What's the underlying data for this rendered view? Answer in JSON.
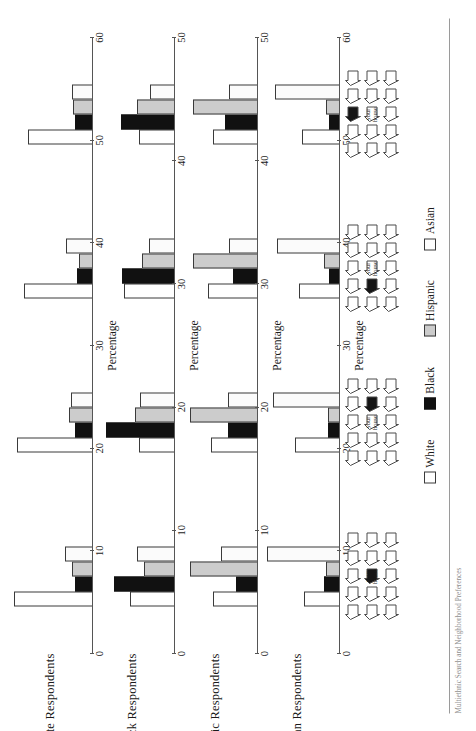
{
  "figure": {
    "caption": "Multiethnic Search and Neighborhood Preferences",
    "legend_title": ""
  },
  "legend": {
    "items": [
      {
        "label": "White",
        "key": "white",
        "color": "#ffffff"
      },
      {
        "label": "Black",
        "key": "black",
        "color": "#111111"
      },
      {
        "label": "Hispanic",
        "key": "hispanic",
        "color": "#cccccc"
      },
      {
        "label": "Asian",
        "key": "asian",
        "color": "#ffffff"
      }
    ]
  },
  "axis": {
    "title": "Percentage"
  },
  "neighborhoods": [
    {
      "name": "neighborhood-a",
      "your_house_label": [
        "your",
        "house"
      ],
      "rows": 3,
      "cols": 5,
      "shaded_index": 7,
      "center_index": 7
    },
    {
      "name": "neighborhood-b",
      "your_house_label": [
        "your",
        "house"
      ],
      "rows": 3,
      "cols": 5,
      "shaded_index": 8,
      "center_index": 7
    },
    {
      "name": "neighborhood-c",
      "your_house_label": [
        "your",
        "house"
      ],
      "rows": 3,
      "cols": 5,
      "shaded_index": 6,
      "center_index": 7
    },
    {
      "name": "neighborhood-d",
      "your_house_label": [
        "your",
        "house"
      ],
      "rows": 3,
      "cols": 5,
      "shaded_index": 2,
      "center_index": 7
    }
  ],
  "chart_data": {
    "type": "bar",
    "title": "",
    "xlabel": "",
    "ylabel": "Percentage",
    "grid": false,
    "legend_position": "bottom",
    "categories": [
      "Neighborhood A",
      "Neighborhood B",
      "Neighborhood C",
      "Neighborhood D"
    ],
    "series_names": [
      "White",
      "Black",
      "Hispanic",
      "Asian"
    ],
    "panels": [
      {
        "title": "White Respondents",
        "ylim": [
          0,
          60
        ],
        "yticks": [
          0,
          10,
          20,
          30,
          40,
          50,
          60
        ],
        "ytick_labels": [
          "0",
          "10",
          "20",
          "30",
          "40",
          "50",
          "60"
        ],
        "series": [
          {
            "name": "White",
            "values": [
              57,
              55,
              50,
              47
            ]
          },
          {
            "name": "Black",
            "values": [
              13,
              13,
              11,
              13
            ]
          },
          {
            "name": "Hispanic",
            "values": [
              15,
              17,
              10,
              14
            ]
          },
          {
            "name": "Asian",
            "values": [
              20,
              16,
              19,
              15
            ]
          }
        ]
      },
      {
        "title": "Black Respondents",
        "ylim": [
          0,
          50
        ],
        "yticks": [
          0,
          10,
          20,
          30,
          40,
          50
        ],
        "ytick_labels": [
          "0",
          "10",
          "20",
          "30",
          "40",
          "50"
        ],
        "series": [
          {
            "name": "White",
            "values": [
              27,
              22,
              31,
              22
            ]
          },
          {
            "name": "Black",
            "values": [
              37,
              42,
              32,
              33
            ]
          },
          {
            "name": "Hispanic",
            "values": [
              19,
              24,
              20,
              23
            ]
          },
          {
            "name": "Asian",
            "values": [
              23,
              21,
              16,
              15
            ]
          }
        ]
      },
      {
        "title": "Hispanic Respondents",
        "ylim": [
          0,
          50
        ],
        "yticks": [
          0,
          10,
          20,
          30,
          40,
          50
        ],
        "ytick_labels": [
          "0",
          "10",
          "20",
          "30",
          "40",
          "50"
        ],
        "series": [
          {
            "name": "White",
            "values": [
              27,
              28,
              30,
              27
            ]
          },
          {
            "name": "Black",
            "values": [
              13,
              18,
              15,
              20
            ]
          },
          {
            "name": "Hispanic",
            "values": [
              41,
              41,
              39,
              39
            ]
          },
          {
            "name": "Asian",
            "values": [
              22,
              18,
              17,
              17
            ]
          }
        ]
      },
      {
        "title": "Asian Respondents",
        "ylim": [
          0,
          60
        ],
        "yticks": [
          0,
          10,
          20,
          30,
          40,
          50,
          60
        ],
        "ytick_labels": [
          "0",
          "10",
          "20",
          "30",
          "40",
          "50",
          "60"
        ],
        "series": [
          {
            "name": "White",
            "values": [
              26,
              33,
              30,
              28
            ]
          },
          {
            "name": "Black",
            "values": [
              12,
              9,
              8,
              8
            ]
          },
          {
            "name": "Hispanic",
            "values": [
              10,
              9,
              12,
              10
            ]
          },
          {
            "name": "Asian",
            "values": [
              53,
              49,
              46,
              47
            ]
          }
        ]
      }
    ]
  }
}
